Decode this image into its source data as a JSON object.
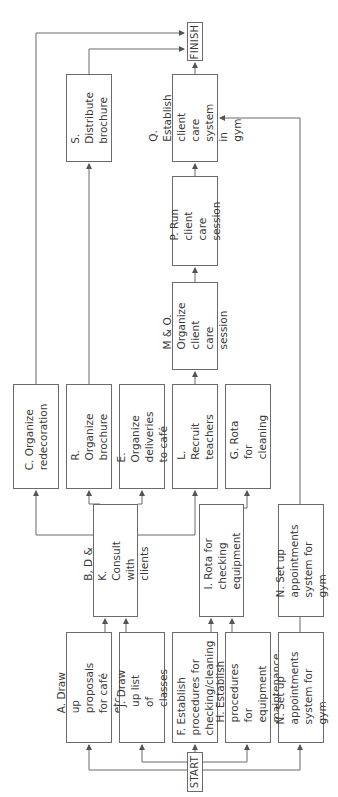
{
  "diagram": {
    "type": "network/activity flow (rotated 90° counter-clockwise)",
    "start": "START",
    "finish": "FINISH",
    "nodes": {
      "A": "A. Draw up proposals\nfor café etc.",
      "J": "J. Draw up list of\nclasses",
      "F": "F. Establish\nprocedures for\nchecking/cleaning",
      "H": "H. Establish procedures\nfor equipment\nmaintenance",
      "N1": "N. Set up appointments\nsystem for gym",
      "BDK": "B, D & K. Consult with\nclients",
      "I": "I. Rota for checking\nequipment",
      "N2": "N. Set up appointments\nsystem for gym",
      "C": "C. Organize\nredecoration",
      "R": "R. Organize\nbrochure",
      "E": "E. Organize deliveries\nto café",
      "L": "L. Recruit teachers",
      "G": "G. Rota for cleaning",
      "MO": "M & O. Organize\nclient care session",
      "P": "P. Run client care\nsession",
      "Q": "Q. Establish client\ncare system in\ngym",
      "S": "S. Distribute\nbrochure"
    },
    "edges": [
      [
        "START",
        "A"
      ],
      [
        "START",
        "J"
      ],
      [
        "START",
        "F"
      ],
      [
        "START",
        "H"
      ],
      [
        "START",
        "N1"
      ],
      [
        "A",
        "BDK"
      ],
      [
        "J",
        "BDK"
      ],
      [
        "F",
        "I"
      ],
      [
        "H",
        "I"
      ],
      [
        "N1",
        "N2"
      ],
      [
        "BDK",
        "C"
      ],
      [
        "BDK",
        "R"
      ],
      [
        "BDK",
        "E"
      ],
      [
        "BDK",
        "L"
      ],
      [
        "I",
        "G"
      ],
      [
        "L",
        "MO"
      ],
      [
        "MO",
        "P"
      ],
      [
        "P",
        "Q"
      ],
      [
        "N2",
        "Q"
      ],
      [
        "R",
        "S"
      ],
      [
        "S",
        "FINISH"
      ],
      [
        "C",
        "FINISH"
      ],
      [
        "Q",
        "FINISH"
      ]
    ],
    "colors": {
      "line": "#6b6b6b",
      "text": "#3a3a3a",
      "background": "#ffffff"
    }
  }
}
